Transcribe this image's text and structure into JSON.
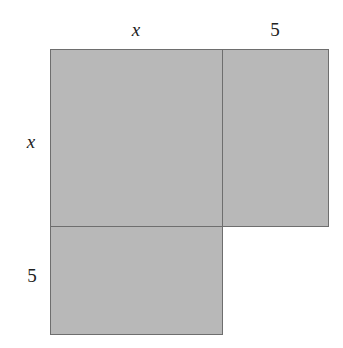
{
  "diagram": {
    "fill_color": "#b8b8b8",
    "stroke_color": "#6e6e6e",
    "labels": {
      "top_left": "x",
      "top_right": "5",
      "left_top": "x",
      "left_bottom": "5"
    },
    "regions": [
      {
        "name": "x-by-x-square",
        "width": "x",
        "height": "x"
      },
      {
        "name": "5-by-x-rectangle",
        "width": "5",
        "height": "x"
      },
      {
        "name": "x-by-5-rectangle",
        "width": "x",
        "height": "5"
      }
    ]
  }
}
